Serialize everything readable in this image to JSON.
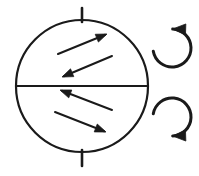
{
  "figure": {
    "background_color": "#ffffff",
    "ink_color": "#1a1a1a",
    "width": 199,
    "height": 176,
    "style": "hand-drawn line art"
  },
  "sphere": {
    "label": "sphere outline",
    "center_x": 82,
    "center_y": 86,
    "radius": 66,
    "stroke_width": 2.2
  },
  "equator": {
    "label": "equator line",
    "x1": 16,
    "y1": 86,
    "x2": 148,
    "y2": 86
  },
  "axis_ticks": [
    {
      "name": "north-pole-tick",
      "x": 82,
      "y1": 8,
      "y2": 22
    },
    {
      "name": "south-pole-tick",
      "x": 82,
      "y1": 150,
      "y2": 166
    }
  ],
  "flow_arrows": [
    {
      "name": "flow-arrow-upper-1",
      "hemisphere": "upper",
      "direction": "up-right",
      "tail_x": 58,
      "tail_y": 54,
      "tip_x": 107,
      "tip_y": 34
    },
    {
      "name": "flow-arrow-upper-2",
      "hemisphere": "upper",
      "direction": "down-left",
      "tail_x": 112,
      "tail_y": 56,
      "tip_x": 62,
      "tip_y": 77
    },
    {
      "name": "flow-arrow-lower-1",
      "hemisphere": "lower",
      "direction": "up-left",
      "tail_x": 112,
      "tail_y": 110,
      "tip_x": 60,
      "tip_y": 90
    },
    {
      "name": "flow-arrow-lower-2",
      "hemisphere": "lower",
      "direction": "down-right",
      "tail_x": 55,
      "tail_y": 112,
      "tip_x": 106,
      "tip_y": 132
    }
  ],
  "rotation_arrows": [
    {
      "name": "rotation-arrow-upper",
      "sense": "counterclockwise",
      "center_x": 172,
      "center_y": 48,
      "radius": 19,
      "arrowhead_position": "top",
      "arrowhead_direction": "up-left"
    },
    {
      "name": "rotation-arrow-lower",
      "sense": "clockwise",
      "center_x": 172,
      "center_y": 117,
      "radius": 19,
      "arrowhead_position": "bottom",
      "arrowhead_direction": "down-left"
    }
  ]
}
